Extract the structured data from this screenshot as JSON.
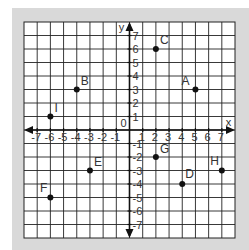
{
  "diagram": {
    "type": "coordinate-plane",
    "x_axis_label": "x",
    "y_axis_label": "y",
    "origin_label": "0",
    "x_range": [
      -7,
      7
    ],
    "y_range": [
      -7,
      7
    ],
    "x_ticks": [
      "-7",
      "-6",
      "-5",
      "-4",
      "-3",
      "-2",
      "-1",
      "1",
      "2",
      "3",
      "4",
      "5",
      "6",
      "7"
    ],
    "y_ticks": [
      "7",
      "6",
      "5",
      "4",
      "3",
      "2",
      "1",
      "-1",
      "-2",
      "-3",
      "-4",
      "-5",
      "-6",
      "-7"
    ],
    "points": [
      {
        "label": "A",
        "x": 5,
        "y": 3
      },
      {
        "label": "B",
        "x": -4,
        "y": 3
      },
      {
        "label": "C",
        "x": 2,
        "y": 6
      },
      {
        "label": "D",
        "x": 4,
        "y": -4
      },
      {
        "label": "E",
        "x": -3,
        "y": -3
      },
      {
        "label": "F",
        "x": -6,
        "y": -5
      },
      {
        "label": "G",
        "x": 2,
        "y": -2
      },
      {
        "label": "H",
        "x": 7,
        "y": -3
      },
      {
        "label": "I",
        "x": -6,
        "y": 1
      }
    ],
    "colors": {
      "frame": "#d9d9d9",
      "grid_bg": "#ffffff",
      "grid_line": "#222222",
      "axis": "#111111",
      "point": "#111111",
      "text": "#333333"
    }
  }
}
